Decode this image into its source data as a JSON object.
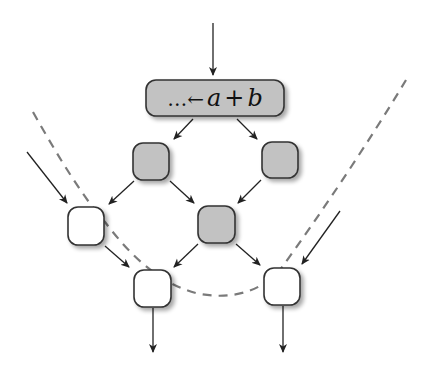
{
  "diagram": {
    "top_node": {
      "label": "…← a + b",
      "prefix": "…",
      "arrow": "←",
      "expr_a": "a",
      "op": "+",
      "expr_b": "b"
    },
    "colors": {
      "shaded_fill": "#c2c2c2",
      "white_fill": "#ffffff",
      "stroke": "#333333",
      "dashed": "#7a7a7a",
      "shadow": "#b5b5b5"
    },
    "nodes": [
      {
        "id": "top",
        "type": "shaded",
        "x": 146,
        "y": 80,
        "w": 138,
        "h": 36
      },
      {
        "id": "g1",
        "type": "shaded",
        "x": 133,
        "y": 143,
        "w": 36,
        "h": 37
      },
      {
        "id": "g2",
        "type": "shaded",
        "x": 262,
        "y": 142,
        "w": 36,
        "h": 36
      },
      {
        "id": "w1",
        "type": "white",
        "x": 68,
        "y": 207,
        "w": 36,
        "h": 38
      },
      {
        "id": "g3",
        "type": "shaded",
        "x": 198,
        "y": 206,
        "w": 37,
        "h": 37
      },
      {
        "id": "w2",
        "type": "white",
        "x": 134,
        "y": 270,
        "w": 37,
        "h": 37
      },
      {
        "id": "w3",
        "type": "white",
        "x": 264,
        "y": 268,
        "w": 36,
        "h": 37
      }
    ],
    "edges": [
      {
        "from": "input",
        "to": "top"
      },
      {
        "from": "top",
        "to": "g1"
      },
      {
        "from": "top",
        "to": "g2"
      },
      {
        "from": "g1",
        "to": "w1"
      },
      {
        "from": "g1",
        "to": "g3"
      },
      {
        "from": "g2",
        "to": "g3"
      },
      {
        "from": "external-left",
        "to": "w1"
      },
      {
        "from": "w1",
        "to": "w2"
      },
      {
        "from": "g3",
        "to": "w2"
      },
      {
        "from": "g3",
        "to": "w3"
      },
      {
        "from": "external-right",
        "to": "w3"
      },
      {
        "from": "w2",
        "to": "output"
      },
      {
        "from": "w3",
        "to": "output"
      }
    ],
    "boundary": "dashed-curve"
  }
}
